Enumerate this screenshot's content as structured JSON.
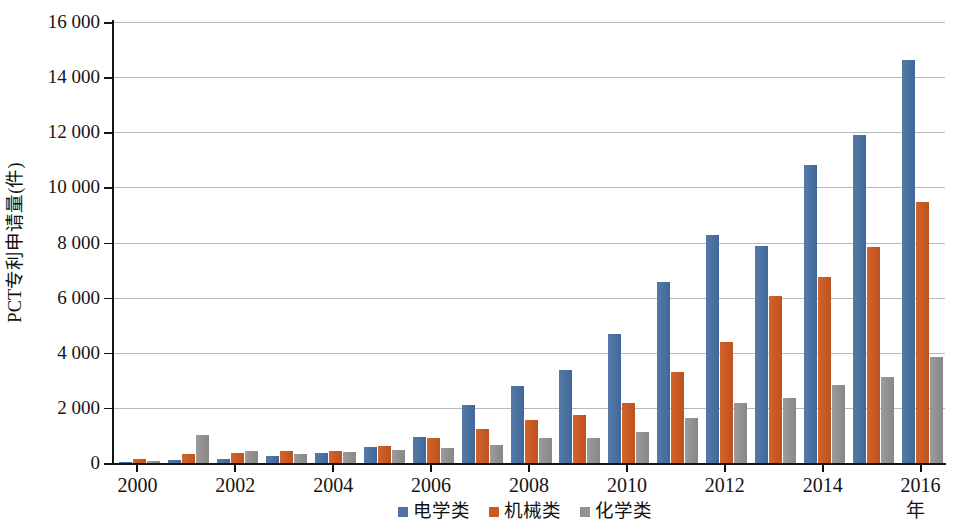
{
  "chart_data": {
    "type": "bar",
    "title": "",
    "xlabel": "年",
    "ylabel": "PCT专利申请量(件)",
    "ylim": [
      0,
      16000
    ],
    "ytick_step": 2000,
    "yticks": [
      "0",
      "2 000",
      "4 000",
      "6 000",
      "8 000",
      "10 000",
      "12 000",
      "14 000",
      "16 000"
    ],
    "grid": true,
    "legend_position": "bottom",
    "categories": [
      "2000",
      "2001",
      "2002",
      "2003",
      "2004",
      "2005",
      "2006",
      "2007",
      "2008",
      "2009",
      "2010",
      "2011",
      "2012",
      "2013",
      "2014",
      "2015",
      "2016"
    ],
    "xtick_labels": [
      "2000",
      "2002",
      "2004",
      "2006",
      "2008",
      "2010",
      "2012",
      "2014",
      "2016"
    ],
    "series": [
      {
        "name": "电学类",
        "color": "#4f74a3",
        "values": [
          30,
          110,
          160,
          250,
          370,
          580,
          940,
          2100,
          2790,
          3380,
          4680,
          6570,
          8270,
          7870,
          10810,
          11900,
          14620
        ]
      },
      {
        "name": "机械类",
        "color": "#ca5c24",
        "values": [
          130,
          320,
          350,
          420,
          450,
          620,
          890,
          1230,
          1560,
          1740,
          2170,
          3300,
          4390,
          6060,
          6750,
          7830,
          9470
        ]
      },
      {
        "name": "化学类",
        "color": "#939393",
        "values": [
          60,
          1000,
          440,
          310,
          400,
          470,
          560,
          670,
          900,
          900,
          1120,
          1630,
          2180,
          2360,
          2830,
          3120,
          3850
        ]
      }
    ]
  },
  "legend": {
    "items": [
      {
        "label": "电学类",
        "color": "#4f74a3"
      },
      {
        "label": "机械类",
        "color": "#ca5c24"
      },
      {
        "label": "化学类",
        "color": "#939393"
      }
    ]
  }
}
